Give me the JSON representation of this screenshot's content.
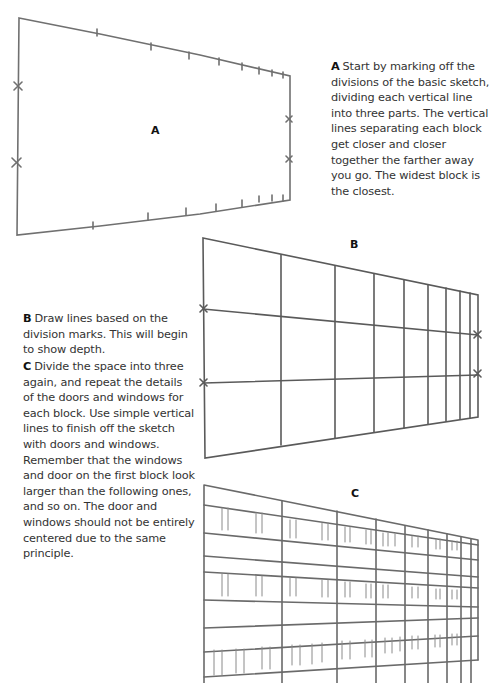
{
  "figures": [
    {
      "label": "A",
      "caption_lead": "A",
      "caption": "Start by marking off the divisions of the basic sketch, dividing each vertical line into three parts. The vertical lines separating each block get closer and closer together the farther away you go. The widest block is the closest."
    },
    {
      "label": "B",
      "caption_lead": "B",
      "caption": "Draw lines based on the division marks. This will begin to show depth."
    },
    {
      "label": "C",
      "caption_lead": "C",
      "caption": "Divide the space into three again, and repeat the details of the doors and windows for each block. Use simple vertical lines to finish off the sketch with doors and windows. Remember that the windows and door on the first block look larger than the following ones, and so on. The door and windows should not be entirely centered due to the same principle."
    }
  ],
  "colors": {
    "pencil": "#6e6e6e",
    "text": "#333333"
  }
}
